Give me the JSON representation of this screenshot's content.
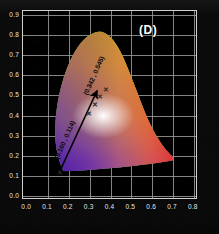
{
  "figure": {
    "panel_label": "(D)",
    "background_color": "#000000",
    "grid_color": "#9b9b9b",
    "axis_text_color": "#e8e8e8"
  },
  "chart_data": {
    "type": "scatter",
    "title": "(D)",
    "subtitle": "CIE 1931 chromaticity diagram",
    "xlabel": "",
    "ylabel": "",
    "xlim": [
      -0.02,
      0.82
    ],
    "ylim": [
      -0.02,
      0.92
    ],
    "grid": true,
    "legend": "none",
    "xticks": [
      "0.0",
      "0.1",
      "0.2",
      "0.3",
      "0.4",
      "0.5",
      "0.6",
      "0.7",
      "0.8"
    ],
    "xtick_values": [
      0.0,
      0.1,
      0.2,
      0.3,
      0.4,
      0.5,
      0.6,
      0.7,
      0.8
    ],
    "yticks": [
      "0.0",
      "0.1",
      "0.2",
      "0.3",
      "0.4",
      "0.5",
      "0.6",
      "0.7",
      "0.8",
      "0.9"
    ],
    "ytick_values": [
      0.0,
      0.1,
      0.2,
      0.3,
      0.4,
      0.5,
      0.6,
      0.7,
      0.8,
      0.9
    ],
    "points": [
      {
        "name": "start-point",
        "label": "(0.160 , 0.114)",
        "x": 0.16,
        "y": 0.114,
        "marker": "x"
      },
      {
        "name": "end-point",
        "label": "(0.342 , 0.545)",
        "x": 0.342,
        "y": 0.545,
        "marker": "x"
      }
    ],
    "annotations": [
      {
        "name": "arrow",
        "from": [
          0.16,
          0.114
        ],
        "to": [
          0.342,
          0.545
        ],
        "style": "solid-arrow",
        "color": "#000000"
      },
      {
        "name": "start-label",
        "text": "(0.160 , 0.114)",
        "rotation_deg": -67
      },
      {
        "name": "end-label",
        "text": "(0.342 , 0.545)",
        "rotation_deg": -67
      }
    ],
    "extra_markers": [
      {
        "x": 0.3,
        "y": 0.43,
        "marker": "x"
      },
      {
        "x": 0.315,
        "y": 0.462,
        "marker": "x"
      },
      {
        "x": 0.33,
        "y": 0.495,
        "marker": "x"
      },
      {
        "x": 0.352,
        "y": 0.52,
        "marker": "x"
      }
    ],
    "gamut": {
      "description": "CIE 1931 spectral locus horseshoe filled with chromaticity colors",
      "white_point": [
        0.4,
        0.36
      ]
    }
  }
}
